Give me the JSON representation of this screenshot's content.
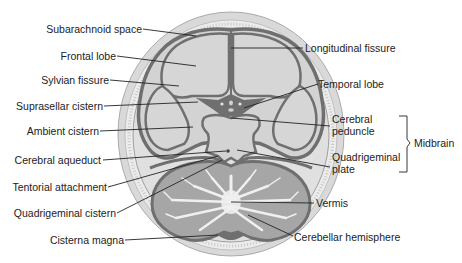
{
  "diagram": {
    "colors": {
      "background": "#ffffff",
      "scalp": "#d8d8d8",
      "skull": "#ebebeb",
      "subarachnoid": "#e2e2e2",
      "brain": "#d4d4d4",
      "csf_dark": "#7a7a7a",
      "cerebellum_gray": "#a8a8a8",
      "white_matter": "#f2f2f2",
      "leader_line": "#222222",
      "text": "#222222"
    },
    "labels_left": [
      {
        "id": "subarachnoid-space",
        "text": "Subarachnoid space"
      },
      {
        "id": "frontal-lobe",
        "text": "Frontal lobe"
      },
      {
        "id": "sylvian-fissure",
        "text": "Sylvian fissure"
      },
      {
        "id": "suprasellar-cistern",
        "text": "Suprasellar cistern"
      },
      {
        "id": "ambient-cistern",
        "text": "Ambient cistern"
      },
      {
        "id": "cerebral-aqueduct",
        "text": "Cerebral aqueduct"
      },
      {
        "id": "tentorial-attachment",
        "text": "Tentorial attachment"
      },
      {
        "id": "quadrigeminal-cistern",
        "text": "Quadrigeminal cistern"
      },
      {
        "id": "cisterna-magna",
        "text": "Cisterna magna"
      }
    ],
    "labels_right": [
      {
        "id": "longitudinal-fissure",
        "text": "Longitudinal fissure"
      },
      {
        "id": "temporal-lobe",
        "text": "Temporal lobe"
      },
      {
        "id": "cerebral-peduncle",
        "line1": "Cerebral",
        "line2": "peduncle"
      },
      {
        "id": "quadrigeminal-plate",
        "line1": "Quadrigeminal",
        "line2": "plate"
      },
      {
        "id": "vermis",
        "text": "Vermis"
      },
      {
        "id": "cerebellar-hemisphere",
        "text": "Cerebellar hemisphere"
      }
    ],
    "bracket_label": "Midbrain"
  }
}
